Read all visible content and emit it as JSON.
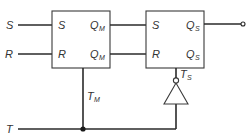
{
  "diagram": {
    "title": "",
    "inputs": {
      "s": "S",
      "r": "R",
      "t": "T"
    },
    "master": {
      "name": "master-flip-flop",
      "pins": {
        "s": "S",
        "r": "R",
        "q_main": "Q",
        "q_main_sub": "M",
        "q_comp": "Q",
        "q_comp_sub": "M"
      },
      "clock_label": "T",
      "clock_label_sub": "M"
    },
    "slave": {
      "name": "slave-flip-flop",
      "pins": {
        "s": "S",
        "r": "R",
        "q_main": "Q",
        "q_main_sub": "S",
        "q_comp": "Q",
        "q_comp_sub": "S"
      },
      "clock_label": "T",
      "clock_label_sub": "S"
    },
    "inverter": {
      "type": "NOT gate"
    },
    "colors": {
      "line": "#2a2a2a",
      "text": "#333333",
      "background": "#ffffff"
    }
  }
}
